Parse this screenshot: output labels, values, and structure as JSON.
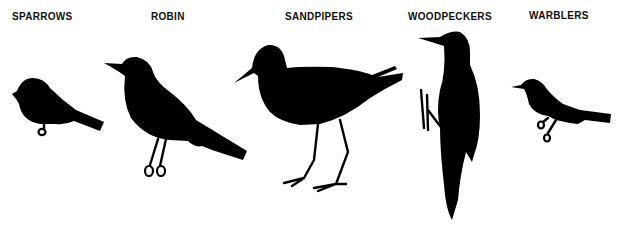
{
  "figure": {
    "background": "#ffffff",
    "silhouette_color": "#000000",
    "birds": [
      {
        "id": "sparrows",
        "label": "SPARROWS"
      },
      {
        "id": "robin",
        "label": "ROBIN"
      },
      {
        "id": "sandpipers",
        "label": "SANDPIPERS"
      },
      {
        "id": "woodpeckers",
        "label": "WOODPECKERS"
      },
      {
        "id": "warblers",
        "label": "WARBLERS"
      }
    ]
  }
}
